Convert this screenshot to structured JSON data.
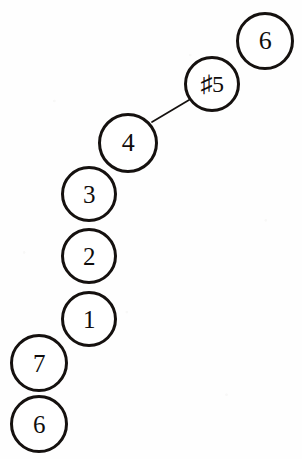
{
  "diagram": {
    "background_color": "#fefefe",
    "stroke_color": "#15110f",
    "text_color": "#100d0c",
    "width": 302,
    "height": 459,
    "nodes": [
      {
        "id": "node-6-top",
        "label": "6",
        "cx": 265,
        "cy": 41,
        "r": 29,
        "stroke_width": 3.2,
        "font_size": 26
      },
      {
        "id": "node-sharp5",
        "label": "♯5",
        "cx": 212,
        "cy": 84,
        "r": 28,
        "stroke_width": 3.4,
        "font_size": 24
      },
      {
        "id": "node-4",
        "label": "4",
        "cx": 128,
        "cy": 143,
        "r": 30,
        "stroke_width": 3.4,
        "font_size": 26
      },
      {
        "id": "node-3",
        "label": "3",
        "cx": 89,
        "cy": 194,
        "r": 28,
        "stroke_width": 3.0,
        "font_size": 25
      },
      {
        "id": "node-2",
        "label": "2",
        "cx": 89,
        "cy": 256,
        "r": 28,
        "stroke_width": 3.0,
        "font_size": 25
      },
      {
        "id": "node-1",
        "label": "1",
        "cx": 89,
        "cy": 319,
        "r": 28,
        "stroke_width": 3.0,
        "font_size": 25
      },
      {
        "id": "node-7",
        "label": "7",
        "cx": 39,
        "cy": 363,
        "r": 29,
        "stroke_width": 3.2,
        "font_size": 25
      },
      {
        "id": "node-6-bottom",
        "label": "6",
        "cx": 39,
        "cy": 424,
        "r": 29,
        "stroke_width": 3.2,
        "font_size": 25
      }
    ],
    "edges": [
      {
        "id": "edge-4-to-sharp5",
        "from": "node-4",
        "to": "node-sharp5",
        "x1": 152,
        "y1": 122,
        "x2": 189,
        "y2": 100,
        "stroke_width": 1.7
      }
    ]
  }
}
